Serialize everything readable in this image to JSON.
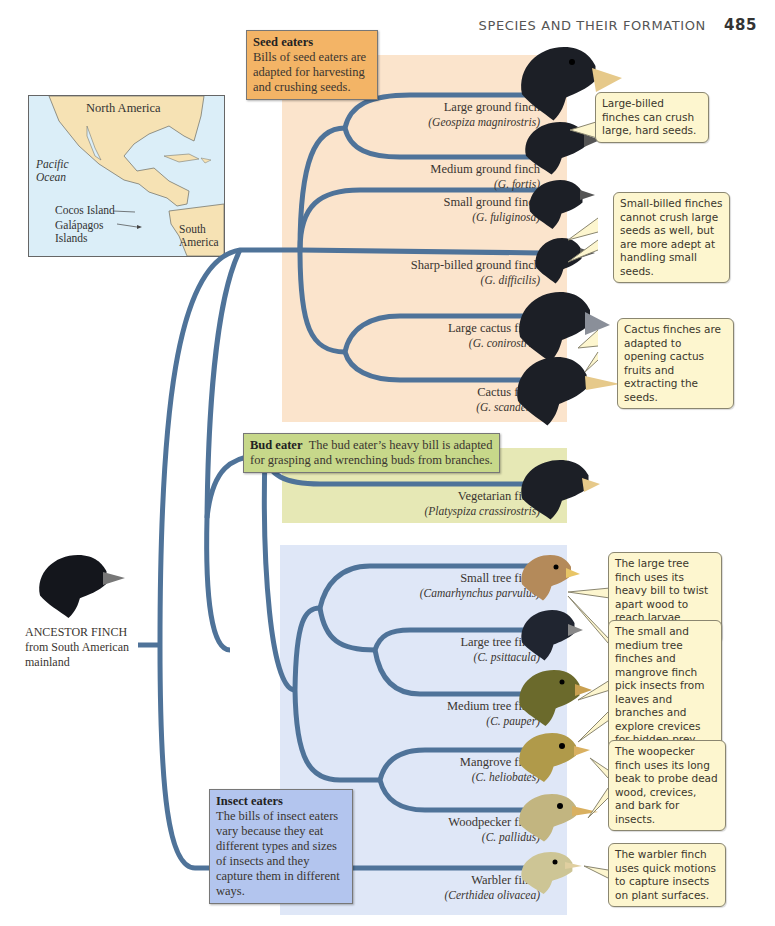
{
  "header": {
    "section_title": "SPECIES AND THEIR FORMATION",
    "page_number": "485"
  },
  "groups": {
    "seed": {
      "title": "Seed eaters",
      "text": "Bills of seed eaters are adapted for harvesting and crushing seeds.",
      "color": "#f3b466",
      "bg": "#fbe4cc"
    },
    "bud": {
      "title": "Bud eater",
      "text": "The bud eater’s heavy bill is adapted for grasping and wrenching buds from branches.",
      "color": "#c7d88a",
      "bg": "#e6e8b5"
    },
    "insect": {
      "title": "Insect eaters",
      "text": "The bills of insect eaters vary because they eat different types and sizes of insects and they capture them in different ways.",
      "color": "#b3c5ee",
      "bg": "#dfe7f7"
    }
  },
  "map": {
    "labels": {
      "north_america": "North America",
      "pacific": "Pacific",
      "ocean": "Ocean",
      "cocos": "Cocos Island",
      "galapagos": "Galápagos",
      "islands": "Islands",
      "south": "South",
      "america": "America"
    }
  },
  "ancestor": {
    "line1": "ANCESTOR FINCH",
    "line2": "from South American",
    "line3": "mainland"
  },
  "species": [
    {
      "name": "Large ground finch",
      "sci": "(Geospiza magnirostris)",
      "group": "seed"
    },
    {
      "name": "Medium ground finch",
      "sci": "(G. fortis)",
      "group": "seed"
    },
    {
      "name": "Small ground finch",
      "sci": "(G. fuliginosa)",
      "group": "seed"
    },
    {
      "name": "Sharp-billed ground finch",
      "sci": "(G. difficilis)",
      "group": "seed"
    },
    {
      "name": "Large cactus finch",
      "sci": "(G. conirostris)",
      "group": "seed"
    },
    {
      "name": "Cactus finch",
      "sci": "(G. scandens)",
      "group": "seed"
    },
    {
      "name": "Vegetarian finch",
      "sci": "(Platyspiza crassirostris)",
      "group": "bud"
    },
    {
      "name": "Small tree finch",
      "sci": "(Camarhynchus parvulus)",
      "group": "insect"
    },
    {
      "name": "Large tree finch",
      "sci": "(C. psittacula)",
      "group": "insect"
    },
    {
      "name": "Medium tree finch",
      "sci": "(C. pauper)",
      "group": "insect"
    },
    {
      "name": "Mangrove finch",
      "sci": "(C. heliobates)",
      "group": "insect"
    },
    {
      "name": "Woodpecker finch",
      "sci": "(C. pallidus)",
      "group": "insect"
    },
    {
      "name": "Warbler finch",
      "sci": "(Certhidea olivacea)",
      "group": "insect"
    }
  ],
  "callouts": [
    "Large-billed finches can crush large, hard seeds.",
    "Small-billed finches cannot crush large seeds as well, but are more adept at handling small seeds.",
    "Cactus finches are adapted to opening cactus fruits and extracting the seeds.",
    "The large tree finch uses its heavy bill to twist apart wood to reach larvae inside.",
    "The small and medium tree finches and mangrove finch pick insects from leaves and branches and explore crevices for hidden prey.",
    "The woopecker finch uses its long beak to probe dead wood, crevices, and bark for insects.",
    "The warbler finch uses quick motions to capture insects on plant surfaces."
  ],
  "colors": {
    "branch": "#4f7399",
    "callout_bg": "#fdf6cf"
  }
}
